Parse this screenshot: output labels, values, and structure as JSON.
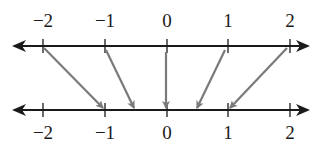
{
  "diagram": {
    "type": "mapping-diagram",
    "top_line": {
      "ticks": [
        -2,
        -1,
        0,
        1,
        2
      ],
      "labels": [
        "−2",
        "−1",
        "0",
        "1",
        "2"
      ]
    },
    "bottom_line": {
      "ticks": [
        -2,
        -1,
        0,
        1,
        2
      ],
      "labels": [
        "−2",
        "−1",
        "0",
        "1",
        "2"
      ]
    },
    "mappings": [
      {
        "from": -2,
        "to": -1
      },
      {
        "from": -1,
        "to": -0.5
      },
      {
        "from": 0,
        "to": 0
      },
      {
        "from": 1,
        "to": 0.5
      },
      {
        "from": 2,
        "to": 1
      }
    ],
    "colors": {
      "line": "#1a1a1a",
      "arrow": "#7a7a7a"
    }
  }
}
